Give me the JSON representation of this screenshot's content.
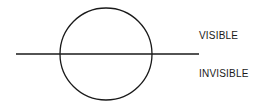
{
  "diagram": {
    "shapes": {
      "circle": {
        "cx": 106,
        "cy": 54,
        "r": 46,
        "stroke": "#1a1a1a"
      },
      "horizon_line": {
        "x1": 16,
        "y1": 54,
        "x2": 199,
        "y2": 54,
        "stroke": "#1a1a1a"
      }
    },
    "labels": {
      "above": "VISIBLE",
      "below": "INVISIBLE"
    }
  }
}
